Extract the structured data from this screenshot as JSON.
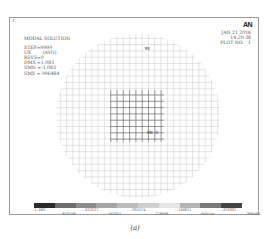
{
  "figure": {
    "corner_number": "1",
    "info_lines": [
      "MODAL SOLUTION",
      "STEP=9999",
      "UX        (AVG)",
      "RSYS=0",
      "DMX =1.083",
      "SMN =-1.083",
      "SMX =.996484"
    ],
    "logo": "AN",
    "date_lines": [
      "JAN 21 2016",
      "14:20:38",
      "PLOT NO.   1"
    ],
    "mx_label": "MX",
    "origin_label": "MN X",
    "caption": "(a)"
  },
  "chart_data": {
    "type": "heatmap",
    "title": "MODAL SOLUTION",
    "subtitle": "STEP=9999, UX (AVG), RSYS=0",
    "annotations": [
      "DMX =1.083",
      "SMN =-1.083",
      "SMX =.996484",
      "JAN 21 2016",
      "14:20:38",
      "PLOT NO. 1",
      "MX",
      "MN X"
    ],
    "legend": {
      "position": "bottom",
      "levels_top": [
        "-1.083",
        "-.622527",
        "-.391574",
        "-.160621",
        ".070332"
      ],
      "levels_bottom": [
        "-.853156",
        "-.507051",
        "-.276098",
        "-.045144",
        ".996484"
      ],
      "colors": [
        "#2a2a2a",
        "#6e6e6e",
        "#8c8c8c",
        "#a6a6a6",
        "#bcbcbc",
        "#d0d0d0",
        "#e6e6e6",
        "#b4b4b4",
        "#7a7a7a",
        "#444444"
      ]
    },
    "shape": "circular plate mesh",
    "grid": true
  },
  "colorbar_labels": [
    {
      "text": "-1.083",
      "x": 0,
      "y": 0
    },
    {
      "text": "-.853156",
      "x": 26,
      "y": 4
    },
    {
      "text": "-.622527",
      "x": 49,
      "y": 0
    },
    {
      "text": "-.507051",
      "x": 72,
      "y": 4
    },
    {
      "text": "-.391574",
      "x": 96,
      "y": 0
    },
    {
      "text": "-.276098",
      "x": 119,
      "y": 4
    },
    {
      "text": "-.160621",
      "x": 142,
      "y": 0
    },
    {
      "text": "-.045144",
      "x": 165,
      "y": 4
    },
    {
      "text": ".070332",
      "x": 189,
      "y": 0
    },
    {
      "text": ".996484",
      "x": 213,
      "y": 4
    }
  ]
}
